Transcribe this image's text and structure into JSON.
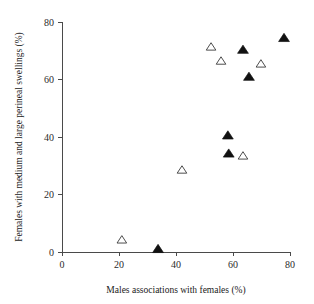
{
  "chart_data": {
    "type": "scatter",
    "title": "",
    "xlabel": "Males associations with females (%)",
    "ylabel": "Females with medium and large perineal swellings (%)",
    "xlim": [
      0,
      80
    ],
    "ylim": [
      0,
      80
    ],
    "xticks": [
      0,
      20,
      40,
      60,
      80
    ],
    "yticks": [
      0,
      20,
      40,
      60,
      80
    ],
    "xtick_labels": [
      "0",
      "20",
      "40",
      "60",
      "80"
    ],
    "ytick_labels": [
      "0",
      "20",
      "40",
      "60",
      "80"
    ],
    "grid": false,
    "legend": "none",
    "series": [
      {
        "name": "filled-triangle",
        "marker": "triangle-filled",
        "color": "#111111",
        "points": [
          {
            "x": 33.7,
            "y": 1.0
          },
          {
            "x": 58.2,
            "y": 40.5
          },
          {
            "x": 58.5,
            "y": 34.2
          },
          {
            "x": 63.5,
            "y": 70.3
          },
          {
            "x": 65.6,
            "y": 60.9
          },
          {
            "x": 77.9,
            "y": 74.4
          }
        ]
      },
      {
        "name": "open-triangle",
        "marker": "triangle-open",
        "color": "#ffffff",
        "points": [
          {
            "x": 21.0,
            "y": 4.2
          },
          {
            "x": 42.1,
            "y": 28.5
          },
          {
            "x": 52.3,
            "y": 71.3
          },
          {
            "x": 55.8,
            "y": 66.4
          },
          {
            "x": 63.5,
            "y": 33.4
          },
          {
            "x": 69.8,
            "y": 65.4
          }
        ]
      }
    ]
  },
  "axes": {
    "x_title": "Males associations with females (%)",
    "y_title": "Females with medium and large perineal swellings (%)"
  }
}
